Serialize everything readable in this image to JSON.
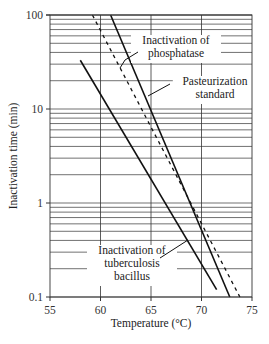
{
  "chart_data": {
    "type": "line",
    "title": "",
    "xlabel": "Temperature (°C)",
    "ylabel": "Inactivation time (min)",
    "xlim": [
      55,
      75
    ],
    "ylim": [
      0.1,
      100
    ],
    "yscale": "log",
    "grid": true,
    "x_ticks": [
      "55",
      "60",
      "65",
      "70",
      "75"
    ],
    "y_ticks": [
      "0.1",
      "1",
      "10",
      "100"
    ],
    "series": [
      {
        "name": "Inactivation of phosphatase",
        "style": "solid",
        "x": [
          61.0,
          72.8
        ],
        "y": [
          100,
          0.1
        ]
      },
      {
        "name": "Pasteurization standard",
        "style": "dashed",
        "x": [
          59.2,
          73.8
        ],
        "y": [
          100,
          0.1
        ]
      },
      {
        "name": "Inactivation of tuberculosis bacillus",
        "style": "solid",
        "x": [
          58.0,
          71.5
        ],
        "y": [
          33,
          0.12
        ]
      }
    ],
    "annotations": [
      {
        "text": [
          "Inactivation of",
          "phosphatase"
        ]
      },
      {
        "text": [
          "Pasteurization",
          "standard"
        ]
      },
      {
        "text": [
          "Inactivation of",
          "tuberculosis",
          "bacillus"
        ]
      }
    ]
  }
}
